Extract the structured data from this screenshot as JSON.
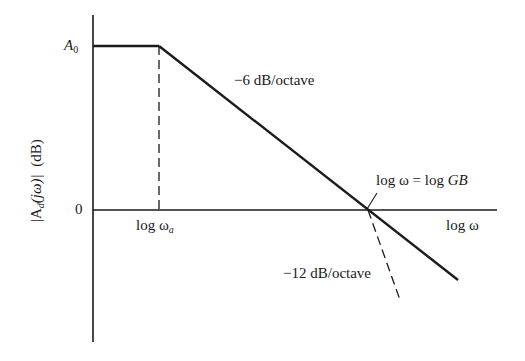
{
  "diagram": {
    "type": "bode-magnitude-plot",
    "y_axis": {
      "label_prefix": "|A",
      "label_sub": "d",
      "label_mid": "(jω)|",
      "label_unit": "(dB)",
      "ticks": {
        "top": {
          "symbol": "A",
          "sub": "0"
        },
        "zero": "0"
      }
    },
    "x_axis": {
      "label": "log ω",
      "ticks": {
        "corner": {
          "prefix": "log ω",
          "sub": "a"
        }
      }
    },
    "annotations": {
      "slope_main": "−6 dB/octave",
      "slope_steep": "−12 dB/octave",
      "crossing_prefix": "log ω = log ",
      "crossing_var": "GB"
    },
    "colors": {
      "line": "#1a1a1a",
      "background": "#ffffff"
    }
  }
}
